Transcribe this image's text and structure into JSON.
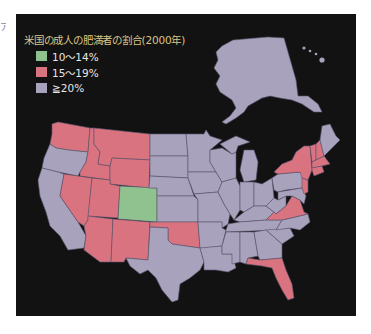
{
  "page": {
    "edge_text": "ア"
  },
  "map": {
    "title": "米国の成人の肥満者の割合(2000年)",
    "background_color": "#121212",
    "title_color": "#d8c58a",
    "legend": [
      {
        "label": "10〜14%",
        "color": "#8fc28e",
        "category": "low"
      },
      {
        "label": "15〜19%",
        "color": "#d9737f",
        "category": "mid"
      },
      {
        "label": "≧20%",
        "color": "#a8a2bc",
        "category": "high"
      }
    ],
    "categories": {
      "low": [
        "Colorado"
      ],
      "mid": [
        "Washington",
        "Idaho",
        "Montana",
        "Wyoming",
        "Nevada",
        "Utah",
        "Arizona",
        "New Mexico",
        "Oklahoma",
        "Virginia",
        "Florida",
        "New York",
        "Vermont",
        "New Hampshire",
        "Massachusetts",
        "Connecticut",
        "Rhode Island",
        "New Jersey"
      ],
      "high": [
        "Oregon",
        "California",
        "North Dakota",
        "South Dakota",
        "Nebraska",
        "Kansas",
        "Texas",
        "Minnesota",
        "Iowa",
        "Missouri",
        "Arkansas",
        "Louisiana",
        "Wisconsin",
        "Illinois",
        "Michigan",
        "Indiana",
        "Ohio",
        "Kentucky",
        "Tennessee",
        "Mississippi",
        "Alabama",
        "Georgia",
        "South Carolina",
        "North Carolina",
        "West Virginia",
        "Pennsylvania",
        "Maryland",
        "Delaware",
        "Maine",
        "Alaska",
        "Hawaii"
      ]
    }
  }
}
